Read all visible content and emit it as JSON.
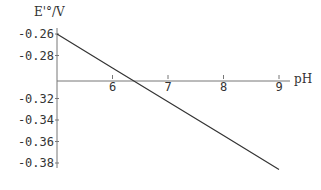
{
  "chart_data": {
    "type": "line",
    "title": "",
    "xlabel": "pH",
    "ylabel": "E'°/V",
    "xlim": [
      5,
      9.1
    ],
    "ylim": [
      -0.39,
      -0.255
    ],
    "x_axis_crosses_y_at": -0.3,
    "x_ticks": [
      "6",
      "7",
      "8",
      "9"
    ],
    "y_ticks": [
      "-0.26",
      "-0.28",
      "-0.32",
      "-0.34",
      "-0.36",
      "-0.38"
    ],
    "grid": false,
    "legend": null,
    "series": [
      {
        "name": "E'° vs pH",
        "x": [
          5,
          6,
          7,
          8,
          9
        ],
        "y": [
          -0.26,
          -0.2915,
          -0.323,
          -0.3545,
          -0.386
        ]
      }
    ]
  },
  "colors": {
    "line": "#333333",
    "axis": "#777777",
    "text": "#333333"
  }
}
